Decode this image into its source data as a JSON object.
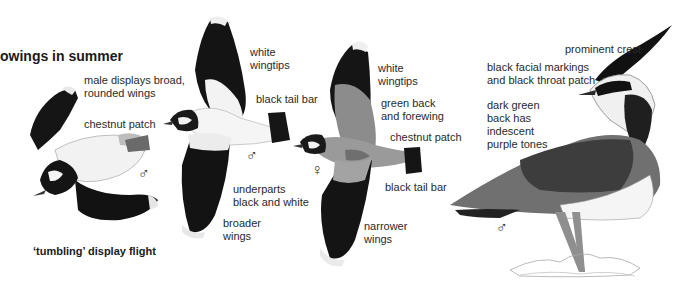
{
  "plate": {
    "title": "owings in summer",
    "caption": "‘tumbling’ display flight"
  },
  "figures": [
    {
      "id": "tumbling-male",
      "sex_symbol": "♂",
      "labels": [
        "male displays broad,\nrounded wings",
        "chestnut patch"
      ]
    },
    {
      "id": "flying-male",
      "sex_symbol": "♂",
      "labels": [
        "white\nwingtips",
        "black tail bar",
        "underparts\nblack and white",
        "broader\nwings"
      ]
    },
    {
      "id": "flying-female",
      "sex_symbol": "♀",
      "labels": [
        "white\nwingtips",
        "green back\nand forewing",
        "chestnut patch",
        "black tail bar",
        "narrower\nwings"
      ]
    },
    {
      "id": "standing-male",
      "sex_symbol": "♂",
      "labels": [
        "prominent crest",
        "black facial markings\nand black throat patch",
        "dark green\nback has\nindescent\npurple tones"
      ]
    }
  ]
}
